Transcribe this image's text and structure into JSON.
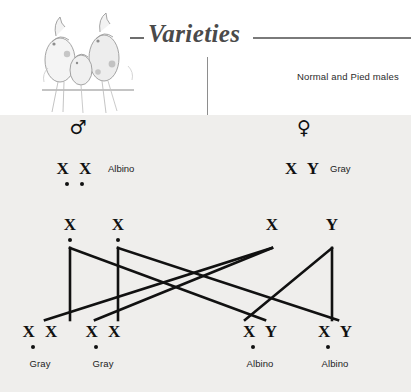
{
  "header": {
    "title": "Varieties",
    "caption": "Normal and Pied males",
    "bird_illustration_name": "three-cockatiels-on-perch"
  },
  "diagram": {
    "male_symbol": "♂",
    "female_symbol": "♀",
    "parents": [
      {
        "sex": "male",
        "chromosomes": "X X",
        "dots": [
          0,
          1
        ],
        "phenotype": "Albino"
      },
      {
        "sex": "female",
        "chromosomes": "X Y",
        "dots": [],
        "phenotype": "Gray"
      }
    ],
    "gametes": [
      {
        "parent": "male",
        "chromosome": "X",
        "dotted": true
      },
      {
        "parent": "male",
        "chromosome": "X",
        "dotted": true
      },
      {
        "parent": "female",
        "chromosome": "X",
        "dotted": false
      },
      {
        "parent": "female",
        "chromosome": "Y",
        "dotted": false
      }
    ],
    "offspring": [
      {
        "chromosomes": "X X",
        "dots": [
          0
        ],
        "phenotype": "Gray"
      },
      {
        "chromosomes": "X X",
        "dots": [
          0
        ],
        "phenotype": "Gray"
      },
      {
        "chromosomes": "X Y",
        "dots": [
          0
        ],
        "phenotype": "Albino"
      },
      {
        "chromosomes": "X Y",
        "dots": [
          0
        ],
        "phenotype": "Albino"
      }
    ],
    "colors": {
      "panel_background": "#efeeec",
      "ink": "#111111",
      "title": "#4a4a4a",
      "rule": "#7a7a7a"
    }
  }
}
